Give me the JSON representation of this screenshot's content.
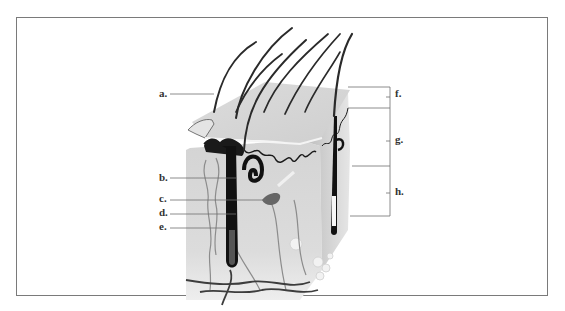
{
  "figure": {
    "type": "anatomical diagram",
    "colors": {
      "frame": "#7a7a7a",
      "leader_line": "#6e6e6e",
      "tissue_light": "#e2e2e2",
      "tissue_mid": "#c8c8c8",
      "structure_dark": "#1a1a1a"
    }
  },
  "labels": {
    "left": [
      {
        "id": "a",
        "text": "a."
      },
      {
        "id": "b",
        "text": "b."
      },
      {
        "id": "c",
        "text": "c."
      },
      {
        "id": "d",
        "text": "d."
      },
      {
        "id": "e",
        "text": "e."
      }
    ],
    "right": [
      {
        "id": "f",
        "text": "f."
      },
      {
        "id": "g",
        "text": "g."
      },
      {
        "id": "h",
        "text": "h."
      }
    ]
  }
}
